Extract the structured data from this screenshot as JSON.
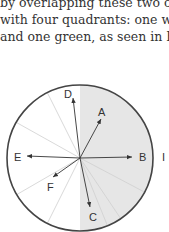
{
  "paragraph": {
    "lines": [
      "by overlapping these two ci",
      "with four quadrants: one wh",
      "and one green, as seen in Fig"
    ]
  },
  "figure": {
    "circle": {
      "cx": 80,
      "cy": 158,
      "r": 73,
      "shaded_half": "right",
      "shade_color": "#e6e6e6",
      "stroke_color": "#444444"
    },
    "vectors": [
      {
        "label": "A"
      },
      {
        "label": "B"
      },
      {
        "label": "C"
      },
      {
        "label": "D"
      },
      {
        "label": "E"
      },
      {
        "label": "F"
      }
    ],
    "side_label": "I"
  }
}
